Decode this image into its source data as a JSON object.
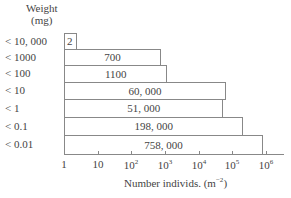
{
  "chart_data": {
    "type": "bar",
    "orientation": "horizontal",
    "title": "",
    "ylabel": "Weight (mg)",
    "xlabel": "Number individs. (m^-2)",
    "xscale": "log",
    "xlim": [
      1,
      1000000
    ],
    "xticks": [
      "1",
      "10",
      "10^2",
      "10^3",
      "10^4",
      "10^5",
      "10^6"
    ],
    "grid": false,
    "legend": null,
    "categories": [
      "<10,000",
      "<1000",
      "<100",
      "<10",
      "<1",
      "<0.1",
      "<0.01"
    ],
    "values": [
      2,
      700,
      1100,
      60000,
      51000,
      198000,
      758000
    ],
    "value_labels": [
      "2",
      "700",
      "1100",
      "60,000",
      "51,000",
      "198,000",
      "758,000"
    ]
  },
  "labels": {
    "y_title_line1": "Weight",
    "y_title_line2": "(mg)",
    "x_title_main": "Number individs. (m",
    "x_title_exp": "−2",
    "x_title_end": ")"
  },
  "categories": [
    "< 10, 000",
    "< 1000",
    "< 100",
    "< 10",
    "< 1",
    "< 0.1",
    "< 0.01"
  ],
  "value_labels": [
    "2",
    "700",
    "1100",
    "60, 000",
    "51, 000",
    "198, 000",
    "758, 000"
  ],
  "ticks": [
    {
      "base": "1",
      "exp": ""
    },
    {
      "base": "10",
      "exp": ""
    },
    {
      "base": "10",
      "exp": "2"
    },
    {
      "base": "10",
      "exp": "3"
    },
    {
      "base": "10",
      "exp": "4"
    },
    {
      "base": "10",
      "exp": "5"
    },
    {
      "base": "10",
      "exp": "6"
    }
  ]
}
